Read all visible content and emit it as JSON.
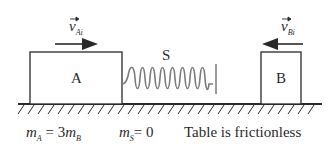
{
  "diagram": {
    "block_a": {
      "label": "A"
    },
    "block_b": {
      "label": "B"
    },
    "spring": {
      "label": "S"
    },
    "velocity_a": {
      "symbol": "v",
      "subscript": "Ai",
      "direction": "right"
    },
    "velocity_b": {
      "symbol": "v",
      "subscript": "Bi",
      "direction": "left"
    },
    "captions": {
      "mass_relation": {
        "lhs_symbol": "m",
        "lhs_sub": "A",
        "rhs": "= 3",
        "rhs_symbol": "m",
        "rhs_sub": "B"
      },
      "spring_mass": {
        "symbol": "m",
        "sub": "S",
        "rhs": "= 0"
      },
      "table_note": "Table is frictionless"
    },
    "colors": {
      "ink": "#2a2a2a",
      "spring": "#7a7a7a",
      "background": "#ffffff"
    }
  }
}
